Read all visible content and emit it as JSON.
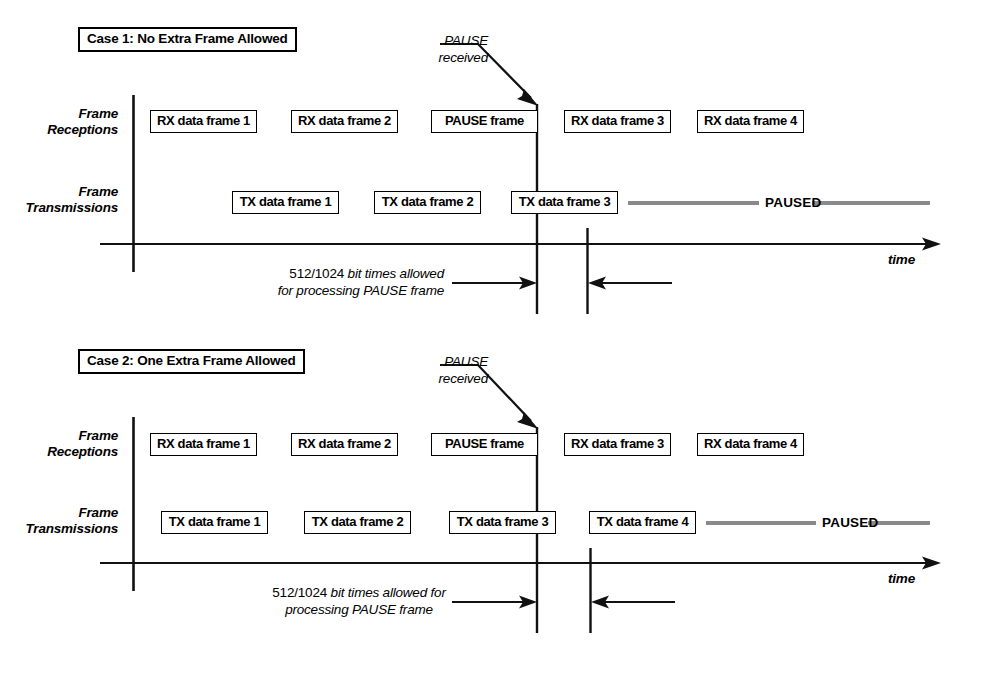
{
  "figure": {
    "type": "timing-diagram",
    "title_implicit": "IEEE 802.3x PAUSE frame reception timing",
    "time_axis_label": "time",
    "paused_label": "PAUSED"
  },
  "cases": [
    {
      "id": "case1",
      "title": "Case 1: No Extra Frame Allowed",
      "row_labels": {
        "receptions_line1": "Frame",
        "receptions_line2": "Receptions",
        "transmissions_line1": "Frame",
        "transmissions_line2": "Transmissions"
      },
      "pause_callout_line1": "PAUSE",
      "pause_callout_line2": "received",
      "rx_frames": [
        "RX data frame 1",
        "RX data frame 2",
        "PAUSE frame",
        "RX data frame 3",
        "RX data frame 4"
      ],
      "tx_frames": [
        "TX data frame 1",
        "TX data frame 2",
        "TX data frame 3"
      ],
      "paused_label": "PAUSED",
      "time_label": "time",
      "processing_note_number": "512/1024",
      "processing_note_line1_rest": " bit times allowed",
      "processing_note_line2": "for processing PAUSE frame"
    },
    {
      "id": "case2",
      "title": "Case 2: One Extra Frame Allowed",
      "row_labels": {
        "receptions_line1": "Frame",
        "receptions_line2": "Receptions",
        "transmissions_line1": "Frame",
        "transmissions_line2": "Transmissions"
      },
      "pause_callout_line1": "PAUSE",
      "pause_callout_line2": "received",
      "rx_frames": [
        "RX data frame 1",
        "RX data frame 2",
        "PAUSE frame",
        "RX data frame 3",
        "RX data frame 4"
      ],
      "tx_frames": [
        "TX data frame 1",
        "TX data frame 2",
        "TX data frame 3",
        "TX data frame 4"
      ],
      "paused_label": "PAUSED",
      "time_label": "time",
      "processing_note_number": "512/1024",
      "processing_note_line1_rest": " bit times allowed for",
      "processing_note_line2": "processing PAUSE frame"
    }
  ],
  "colors": {
    "ink": "#000000",
    "paused_bar": "#8a8a8a",
    "background": "#ffffff"
  }
}
